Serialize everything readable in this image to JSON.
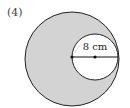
{
  "problem_label": "(4)",
  "diagram": {
    "outer_circle": {
      "cx": 72,
      "cy": 59,
      "r": 47,
      "fill": "#d3d3d3",
      "stroke": "#222222"
    },
    "inner_circle": {
      "cx": 95,
      "cy": 57,
      "r": 23,
      "fill": "#ffffff",
      "stroke": "#222222"
    },
    "diameter_line": {
      "x1": 72,
      "y1": 57,
      "x2": 118,
      "y2": 57
    },
    "points": [
      {
        "x": 72,
        "y": 57
      },
      {
        "x": 95,
        "y": 57
      }
    ],
    "dimension_label": "8 cm"
  }
}
